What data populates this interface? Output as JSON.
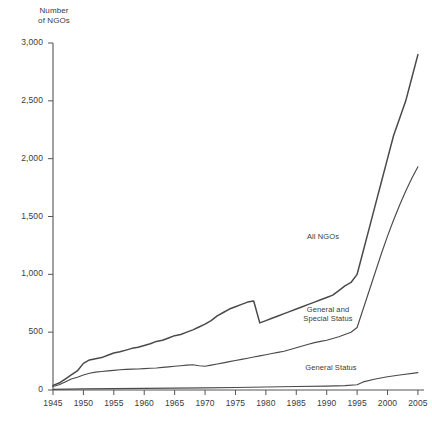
{
  "chart_data": {
    "type": "line",
    "title": "",
    "ylabel": "Number\nof NGOs",
    "xlabel": "",
    "xlim": [
      1945,
      2006
    ],
    "ylim": [
      0,
      3000
    ],
    "grid": false,
    "legend_position": "inline-annotations",
    "yticks": [
      "0",
      "500",
      "1,000",
      "1,500",
      "2,000",
      "2,500",
      "3,000"
    ],
    "ytick_values": [
      0,
      500,
      1000,
      1500,
      2000,
      2500,
      3000
    ],
    "xticks": [
      "1945",
      "1950",
      "1955",
      "1960",
      "1965",
      "1970",
      "1975",
      "1980",
      "1985",
      "1990",
      "1995",
      "2000",
      "2005"
    ],
    "xtick_values": [
      1945,
      1950,
      1955,
      1960,
      1965,
      1970,
      1975,
      1980,
      1985,
      1990,
      1995,
      2000,
      2005
    ],
    "line_color": "#4a4a4a",
    "axis_color": "#555555",
    "series": [
      {
        "name": "All NGOs",
        "label_position": {
          "x": 296,
          "y": 232
        },
        "x": [
          1945,
          1946,
          1947,
          1948,
          1949,
          1950,
          1951,
          1952,
          1953,
          1954,
          1955,
          1956,
          1957,
          1958,
          1959,
          1960,
          1961,
          1962,
          1963,
          1964,
          1965,
          1966,
          1967,
          1968,
          1969,
          1970,
          1971,
          1972,
          1973,
          1974,
          1975,
          1976,
          1977,
          1978,
          1979,
          1980,
          1981,
          1982,
          1983,
          1984,
          1985,
          1986,
          1987,
          1988,
          1989,
          1990,
          1991,
          1992,
          1993,
          1994,
          1995,
          1996,
          1997,
          1998,
          1999,
          2000,
          2001,
          2002,
          2003,
          2004,
          2005
        ],
        "values": [
          40,
          60,
          95,
          130,
          165,
          230,
          260,
          270,
          280,
          300,
          320,
          330,
          345,
          360,
          370,
          385,
          400,
          420,
          430,
          450,
          470,
          480,
          500,
          520,
          545,
          570,
          600,
          640,
          670,
          700,
          720,
          740,
          760,
          770,
          580,
          600,
          620,
          640,
          660,
          680,
          700,
          720,
          740,
          760,
          780,
          800,
          820,
          860,
          900,
          930,
          1000,
          1200,
          1400,
          1600,
          1800,
          2000,
          2200,
          2350,
          2500,
          2700,
          2900
        ]
      },
      {
        "name": "General and Special Status",
        "label_position": {
          "x": 295,
          "y": 305
        },
        "x": [
          1945,
          1946,
          1947,
          1948,
          1949,
          1950,
          1951,
          1952,
          1953,
          1954,
          1955,
          1956,
          1957,
          1958,
          1959,
          1960,
          1961,
          1962,
          1963,
          1964,
          1965,
          1966,
          1967,
          1968,
          1969,
          1970,
          1971,
          1972,
          1973,
          1974,
          1975,
          1976,
          1977,
          1978,
          1979,
          1980,
          1981,
          1982,
          1983,
          1984,
          1985,
          1986,
          1987,
          1988,
          1989,
          1990,
          1991,
          1992,
          1993,
          1994,
          1995,
          1996,
          1997,
          1998,
          1999,
          2000,
          2001,
          2002,
          2003,
          2004,
          2005
        ],
        "values": [
          30,
          45,
          70,
          95,
          110,
          130,
          145,
          155,
          160,
          165,
          170,
          175,
          178,
          180,
          182,
          185,
          188,
          190,
          195,
          200,
          205,
          210,
          215,
          218,
          210,
          205,
          215,
          225,
          235,
          245,
          255,
          265,
          275,
          285,
          295,
          305,
          315,
          325,
          335,
          350,
          365,
          380,
          395,
          410,
          420,
          430,
          445,
          460,
          480,
          500,
          540,
          700,
          860,
          1020,
          1180,
          1330,
          1470,
          1600,
          1720,
          1830,
          1930
        ]
      },
      {
        "name": "General Status",
        "label_position": {
          "x": 293,
          "y": 363
        },
        "x": [
          1945,
          1950,
          1955,
          1960,
          1965,
          1970,
          1975,
          1980,
          1985,
          1990,
          1993,
          1995,
          1996,
          1998,
          2000,
          2002,
          2005
        ],
        "values": [
          5,
          10,
          12,
          14,
          16,
          18,
          22,
          26,
          30,
          34,
          38,
          45,
          70,
          95,
          115,
          130,
          150
        ]
      }
    ]
  },
  "axes": {
    "y_title": "Number\nof NGOs"
  }
}
